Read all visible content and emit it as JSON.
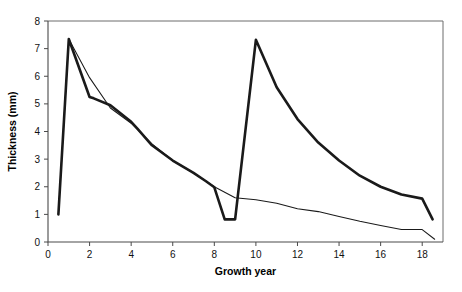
{
  "chart_data": {
    "type": "line",
    "title": "",
    "subtitle": "",
    "xlabel": "Growth year",
    "ylabel": "Thickness (mm)",
    "xlim": [
      0,
      19
    ],
    "ylim": [
      0,
      8
    ],
    "xticks": [
      0,
      2,
      4,
      6,
      8,
      10,
      12,
      14,
      16,
      18
    ],
    "xtick_labels": [
      "0",
      "2",
      "4",
      "6",
      "8",
      "10",
      "12",
      "14",
      "16",
      "18"
    ],
    "yticks": [
      0,
      1,
      2,
      3,
      4,
      5,
      6,
      7,
      8
    ],
    "ytick_labels": [
      "0",
      "1",
      "2",
      "3",
      "4",
      "5",
      "6",
      "7",
      "8"
    ],
    "grid": false,
    "legend": "none",
    "series": [
      {
        "name": "thick-line",
        "style": "thick",
        "color": "#1a1a1a",
        "points": [
          [
            0.5,
            1.0
          ],
          [
            1.0,
            7.35
          ],
          [
            2.0,
            5.25
          ],
          [
            2.2,
            5.2
          ],
          [
            3.0,
            4.95
          ],
          [
            4.0,
            4.35
          ],
          [
            4.3,
            4.1
          ],
          [
            5.0,
            3.5
          ],
          [
            6.0,
            2.95
          ],
          [
            7.0,
            2.5
          ],
          [
            7.6,
            2.2
          ],
          [
            8.0,
            1.98
          ],
          [
            8.5,
            0.82
          ],
          [
            9.0,
            0.82
          ],
          [
            10.0,
            7.32
          ],
          [
            11.0,
            5.6
          ],
          [
            12.0,
            4.45
          ],
          [
            13.0,
            3.6
          ],
          [
            14.0,
            2.95
          ],
          [
            15.0,
            2.4
          ],
          [
            16.0,
            2.0
          ],
          [
            17.0,
            1.72
          ],
          [
            18.0,
            1.57
          ],
          [
            18.5,
            0.82
          ]
        ]
      },
      {
        "name": "thin-line",
        "style": "thin",
        "color": "#1a1a1a",
        "points": [
          [
            0.5,
            1.0
          ],
          [
            1.0,
            7.35
          ],
          [
            2.0,
            5.95
          ],
          [
            3.0,
            4.85
          ],
          [
            4.0,
            4.3
          ],
          [
            5.0,
            3.55
          ],
          [
            6.0,
            2.95
          ],
          [
            7.0,
            2.5
          ],
          [
            8.0,
            2.0
          ],
          [
            9.0,
            1.6
          ],
          [
            10.0,
            1.53
          ],
          [
            11.0,
            1.4
          ],
          [
            12.0,
            1.2
          ],
          [
            13.0,
            1.1
          ],
          [
            14.0,
            0.92
          ],
          [
            15.0,
            0.75
          ],
          [
            16.0,
            0.6
          ],
          [
            17.0,
            0.45
          ],
          [
            18.0,
            0.45
          ],
          [
            18.6,
            0.1
          ]
        ]
      }
    ]
  },
  "plot_geometry": {
    "left": 48,
    "right": 443,
    "top": 21,
    "bottom": 242
  }
}
